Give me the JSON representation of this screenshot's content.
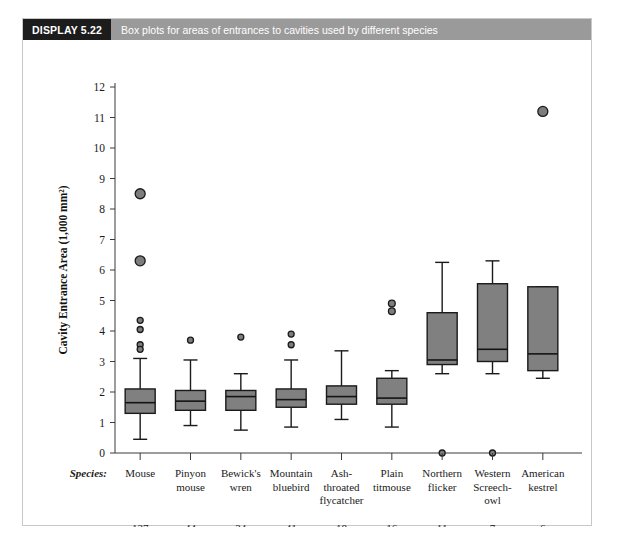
{
  "display": {
    "label": "DISPLAY 5.22",
    "caption": "Box plots for areas of entrances to cavities used by different species",
    "label_bg": "#1c1c1c",
    "caption_bg": "#9a9a9a"
  },
  "axis_rows": {
    "species_header": "Species:",
    "n_header": "n:"
  },
  "colors": {
    "box_fill": "#808080",
    "box_stroke": "#1a1a1a",
    "outlier_fill": "#7d7d7d"
  },
  "chart_data": {
    "type": "box",
    "title": "Box plots for areas of entrances to cavities used by different species",
    "xlabel": "Species:",
    "ylabel": "Cavity Entrance Area (1,000 mm²)",
    "ylim": [
      0,
      12
    ],
    "yticks": [
      0,
      1,
      2,
      3,
      4,
      5,
      6,
      7,
      8,
      9,
      10,
      11,
      12
    ],
    "ytick_labels": [
      "0",
      "1",
      "2",
      "3",
      "4",
      "5",
      "6",
      "7",
      "8",
      "9",
      "10",
      "11",
      "12"
    ],
    "grid": false,
    "legend": null,
    "categories": [
      "Mouse",
      "Pinyon mouse",
      "Bewick's wren",
      "Mountain bluebird",
      "Ash-throated flycatcher",
      "Plain titmouse",
      "Northern flicker",
      "Western Screech-owl",
      "American kestrel"
    ],
    "category_lines": [
      [
        "Mouse"
      ],
      [
        "Pinyon",
        "mouse"
      ],
      [
        "Bewick's",
        "wren"
      ],
      [
        "Mountain",
        "bluebird"
      ],
      [
        "Ash-",
        "throated",
        "flycatcher"
      ],
      [
        "Plain",
        "titmouse"
      ],
      [
        "Northern",
        "flicker"
      ],
      [
        "Western",
        "Screech-",
        "owl"
      ],
      [
        "American",
        "kestrel"
      ]
    ],
    "n": [
      127,
      44,
      24,
      41,
      18,
      16,
      11,
      7,
      6
    ],
    "boxes": [
      {
        "category": "Mouse",
        "whisker_low": 0.45,
        "q1": 1.3,
        "median": 1.65,
        "q3": 2.1,
        "whisker_high": 3.1,
        "outliers": [
          8.5,
          6.3,
          4.35,
          4.05,
          3.55,
          3.4
        ]
      },
      {
        "category": "Pinyon mouse",
        "whisker_low": 0.9,
        "q1": 1.4,
        "median": 1.7,
        "q3": 2.05,
        "whisker_high": 3.05,
        "outliers": [
          3.7
        ]
      },
      {
        "category": "Bewick's wren",
        "whisker_low": 0.75,
        "q1": 1.4,
        "median": 1.85,
        "q3": 2.05,
        "whisker_high": 2.6,
        "outliers": [
          3.8
        ]
      },
      {
        "category": "Mountain bluebird",
        "whisker_low": 0.85,
        "q1": 1.5,
        "median": 1.75,
        "q3": 2.1,
        "whisker_high": 3.05,
        "outliers": [
          3.9,
          3.55
        ]
      },
      {
        "category": "Ash-throated flycatcher",
        "whisker_low": 1.1,
        "q1": 1.6,
        "median": 1.85,
        "q3": 2.2,
        "whisker_high": 3.35,
        "outliers": []
      },
      {
        "category": "Plain titmouse",
        "whisker_low": 0.85,
        "q1": 1.6,
        "median": 1.8,
        "q3": 2.45,
        "whisker_high": 2.7,
        "outliers": [
          4.9,
          4.65
        ]
      },
      {
        "category": "Northern flicker",
        "whisker_low": 2.6,
        "q1": 2.9,
        "median": 3.05,
        "q3": 4.6,
        "whisker_high": 6.25,
        "outliers": [
          0.0
        ]
      },
      {
        "category": "Western Screech-owl",
        "whisker_low": 2.6,
        "q1": 3.0,
        "median": 3.4,
        "q3": 5.55,
        "whisker_high": 6.3,
        "outliers": [
          0.0
        ]
      },
      {
        "category": "American kestrel",
        "whisker_low": 2.45,
        "q1": 2.7,
        "median": 3.25,
        "q3": 5.45,
        "whisker_high": 5.45,
        "outliers": [
          11.2
        ]
      }
    ]
  }
}
